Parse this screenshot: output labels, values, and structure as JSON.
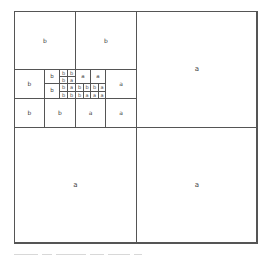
{
  "figure": {
    "type": "quadtree-partition",
    "bounds": {
      "x": 14,
      "y": 11,
      "width": 243,
      "height": 232
    },
    "line_color": "#555555",
    "label_color": "#444444",
    "cells": [
      {
        "id": "q-tr",
        "x": 136,
        "y": 11,
        "w": 121,
        "h": 116,
        "level": 1,
        "label": "a"
      },
      {
        "id": "q-bl",
        "x": 14,
        "y": 127,
        "w": 122,
        "h": 116,
        "level": 1,
        "label": "a"
      },
      {
        "id": "q-br",
        "x": 136,
        "y": 127,
        "w": 121,
        "h": 116,
        "level": 1,
        "label": "a"
      },
      {
        "id": "tl-a",
        "x": 14,
        "y": 11,
        "w": 61,
        "h": 58,
        "level": 2,
        "label": "b"
      },
      {
        "id": "tl-b",
        "x": 75,
        "y": 11,
        "w": 61,
        "h": 58,
        "level": 2,
        "label": "b"
      },
      {
        "id": "r1-c1",
        "x": 14,
        "y": 69,
        "w": 30,
        "h": 29,
        "level": 2,
        "label": "b"
      },
      {
        "id": "r1-c4",
        "x": 105,
        "y": 69,
        "w": 31,
        "h": 29,
        "level": 2,
        "label": "a"
      },
      {
        "id": "r2-c1",
        "x": 14,
        "y": 98,
        "w": 30,
        "h": 29,
        "level": 2,
        "label": "b"
      },
      {
        "id": "r2-c2",
        "x": 44,
        "y": 98,
        "w": 31,
        "h": 29,
        "level": 2,
        "label": "b"
      },
      {
        "id": "r2-c3",
        "x": 75,
        "y": 98,
        "w": 30,
        "h": 29,
        "level": 2,
        "label": "a"
      },
      {
        "id": "r2-c4",
        "x": 105,
        "y": 98,
        "w": 31,
        "h": 29,
        "level": 2,
        "label": "a"
      },
      {
        "id": "c2-tl",
        "x": 44,
        "y": 69,
        "w": 15,
        "h": 14,
        "level": 3,
        "label": "b"
      },
      {
        "id": "c2-bl",
        "x": 44,
        "y": 83,
        "w": 15,
        "h": 15,
        "level": 3,
        "label": "b"
      },
      {
        "id": "c3-tl",
        "x": 75,
        "y": 69,
        "w": 15,
        "h": 14,
        "level": 3,
        "label": "a"
      },
      {
        "id": "c3-tr",
        "x": 90,
        "y": 69,
        "w": 15,
        "h": 14,
        "level": 3,
        "label": "a"
      },
      {
        "id": "f1-1",
        "x": 59,
        "y": 69,
        "w": 8,
        "h": 7,
        "level": 4,
        "label": "b"
      },
      {
        "id": "f1-2",
        "x": 67,
        "y": 69,
        "w": 8,
        "h": 7,
        "level": 4,
        "label": "b"
      },
      {
        "id": "f1-3",
        "x": 59,
        "y": 76,
        "w": 8,
        "h": 7,
        "level": 4,
        "label": "b"
      },
      {
        "id": "f1-4",
        "x": 67,
        "y": 76,
        "w": 8,
        "h": 7,
        "level": 4,
        "label": "a"
      },
      {
        "id": "f2-1",
        "x": 59,
        "y": 83,
        "w": 8,
        "h": 8,
        "level": 4,
        "label": "b"
      },
      {
        "id": "f2-2",
        "x": 67,
        "y": 83,
        "w": 8,
        "h": 8,
        "level": 4,
        "label": "a"
      },
      {
        "id": "f2-3",
        "x": 59,
        "y": 91,
        "w": 8,
        "h": 7,
        "level": 4,
        "label": "b"
      },
      {
        "id": "f2-4",
        "x": 67,
        "y": 91,
        "w": 8,
        "h": 7,
        "level": 4,
        "label": "b"
      },
      {
        "id": "f3-1",
        "x": 75,
        "y": 83,
        "w": 8,
        "h": 8,
        "level": 4,
        "label": "b"
      },
      {
        "id": "f3-2",
        "x": 83,
        "y": 83,
        "w": 7,
        "h": 8,
        "level": 4,
        "label": "b"
      },
      {
        "id": "f3-3",
        "x": 75,
        "y": 91,
        "w": 8,
        "h": 7,
        "level": 4,
        "label": "b"
      },
      {
        "id": "f3-4",
        "x": 83,
        "y": 91,
        "w": 7,
        "h": 7,
        "level": 4,
        "label": "a"
      },
      {
        "id": "f4-1",
        "x": 90,
        "y": 83,
        "w": 8,
        "h": 8,
        "level": 4,
        "label": "b"
      },
      {
        "id": "f4-2",
        "x": 98,
        "y": 83,
        "w": 7,
        "h": 8,
        "level": 4,
        "label": "a"
      },
      {
        "id": "f4-3",
        "x": 90,
        "y": 91,
        "w": 8,
        "h": 7,
        "level": 4,
        "label": "a"
      },
      {
        "id": "f4-4",
        "x": 98,
        "y": 91,
        "w": 7,
        "h": 7,
        "level": 4,
        "label": "a"
      }
    ]
  },
  "caption_trace_segments": [
    24,
    10,
    30,
    14,
    22,
    8
  ]
}
